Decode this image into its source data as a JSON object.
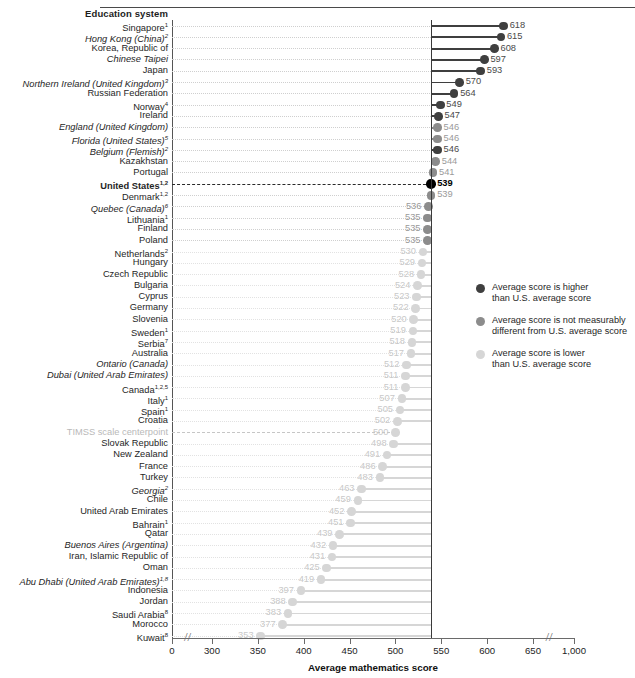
{
  "header": {
    "column_title": "Education system"
  },
  "axis": {
    "title": "Average mathematics score",
    "ticks": [
      "0",
      "300",
      "350",
      "400",
      "450",
      "500",
      "550",
      "600",
      "650",
      "1,000"
    ],
    "tick_values": [
      0,
      300,
      350,
      400,
      450,
      500,
      550,
      600,
      650,
      1000
    ]
  },
  "legend": {
    "position": "right-middle",
    "items": [
      {
        "color": "#3f3f3f",
        "line1": "Average score is higher",
        "line2": "than U.S. average score"
      },
      {
        "color": "#8c8c8c",
        "line1": "Average score is not measurably",
        "line2": "different from U.S. average score"
      },
      {
        "color": "#d6d6d6",
        "line1": "Average score is lower",
        "line2": "than U.S. average score"
      }
    ]
  },
  "colors": {
    "higher": "#3f3f3f",
    "same": "#8c8c8c",
    "lower": "#d6d6d6",
    "us": "#000000",
    "value_higher": "#4a4a4a",
    "value_same": "#9a9a9a",
    "value_lower": "#c9c9c9"
  },
  "chart_data": {
    "type": "bar",
    "xlabel": "Average mathematics score",
    "ylabel": "Education system",
    "xlim": [
      0,
      1000
    ],
    "axis_break": true,
    "reference_line_value": 539,
    "reference_line_label": "United States",
    "centerpoint_value": 500,
    "centerpoint_label": "TIMSS scale centerpoint",
    "grid": "dotted-horizontal",
    "legend_categories": [
      "higher",
      "same",
      "lower"
    ],
    "categories": [
      "Singapore",
      "Hong Kong (China)",
      "Korea, Republic of",
      "Chinese Taipei",
      "Japan",
      "Northern Ireland (United Kingdom)",
      "Russian Federation",
      "Norway",
      "Ireland",
      "England (United Kingdom)",
      "Florida (United States)",
      "Belgium (Flemish)",
      "Kazakhstan",
      "Portugal",
      "United States",
      "Denmark",
      "Quebec (Canada)",
      "Lithuania",
      "Finland",
      "Poland",
      "Netherlands",
      "Hungary",
      "Czech Republic",
      "Bulgaria",
      "Cyprus",
      "Germany",
      "Slovenia",
      "Sweden",
      "Serbia",
      "Australia",
      "Ontario (Canada)",
      "Dubai (United Arab Emirates)",
      "Canada",
      "Italy",
      "Spain",
      "Croatia",
      "TIMSS scale centerpoint",
      "Slovak Republic",
      "New Zealand",
      "France",
      "Turkey",
      "Georgia",
      "Chile",
      "United Arab Emirates",
      "Bahrain",
      "Qatar",
      "Buenos Aires (Argentina)",
      "Iran, Islamic Republic of",
      "Oman",
      "Abu Dhabi (United Arab Emirates)",
      "Indonesia",
      "Jordan",
      "Saudi Arabia",
      "Morocco",
      "Kuwait"
    ],
    "values": [
      618,
      615,
      608,
      597,
      593,
      570,
      564,
      549,
      547,
      546,
      546,
      546,
      544,
      541,
      539,
      539,
      536,
      535,
      535,
      535,
      530,
      529,
      528,
      524,
      523,
      522,
      520,
      519,
      518,
      517,
      512,
      511,
      511,
      507,
      505,
      502,
      500,
      498,
      491,
      486,
      483,
      463,
      459,
      452,
      451,
      439,
      432,
      431,
      425,
      419,
      397,
      388,
      383,
      377,
      353
    ]
  },
  "rows": [
    {
      "label": "Singapore",
      "sup": "1",
      "italic": false,
      "bold": false,
      "value": 618,
      "status": "higher"
    },
    {
      "label": "Hong Kong (China)",
      "sup": "2",
      "italic": true,
      "bold": false,
      "value": 615,
      "status": "higher"
    },
    {
      "label": "Korea, Republic of",
      "sup": "",
      "italic": false,
      "bold": false,
      "value": 608,
      "status": "higher"
    },
    {
      "label": "Chinese Taipei",
      "sup": "",
      "italic": true,
      "bold": false,
      "value": 597,
      "status": "higher"
    },
    {
      "label": "Japan",
      "sup": "",
      "italic": false,
      "bold": false,
      "value": 593,
      "status": "higher"
    },
    {
      "label": "Northern Ireland (United Kingdom)",
      "sup": "3",
      "italic": true,
      "bold": false,
      "value": 570,
      "status": "higher"
    },
    {
      "label": "Russian Federation",
      "sup": "",
      "italic": false,
      "bold": false,
      "value": 564,
      "status": "higher"
    },
    {
      "label": "Norway",
      "sup": "4",
      "italic": false,
      "bold": false,
      "value": 549,
      "status": "higher"
    },
    {
      "label": "Ireland",
      "sup": "",
      "italic": false,
      "bold": false,
      "value": 547,
      "status": "higher"
    },
    {
      "label": "England (United Kingdom)",
      "sup": "",
      "italic": true,
      "bold": false,
      "value": 546,
      "status": "same"
    },
    {
      "label": "Florida (United States)",
      "sup": "5",
      "italic": true,
      "bold": false,
      "value": 546,
      "status": "same"
    },
    {
      "label": "Belgium (Flemish)",
      "sup": "2",
      "italic": true,
      "bold": false,
      "value": 546,
      "status": "higher"
    },
    {
      "label": "Kazakhstan",
      "sup": "",
      "italic": false,
      "bold": false,
      "value": 544,
      "status": "same"
    },
    {
      "label": "Portugal",
      "sup": "",
      "italic": false,
      "bold": false,
      "value": 541,
      "status": "same"
    },
    {
      "label": "United States",
      "sup": "1,2",
      "italic": false,
      "bold": true,
      "value": 539,
      "status": "us"
    },
    {
      "label": "Denmark",
      "sup": "1,2",
      "italic": false,
      "bold": false,
      "value": 539,
      "status": "same"
    },
    {
      "label": "Quebec (Canada)",
      "sup": "6",
      "italic": true,
      "bold": false,
      "value": 536,
      "status": "same"
    },
    {
      "label": "Lithuania",
      "sup": "1",
      "italic": false,
      "bold": false,
      "value": 535,
      "status": "same"
    },
    {
      "label": "Finland",
      "sup": "",
      "italic": false,
      "bold": false,
      "value": 535,
      "status": "same"
    },
    {
      "label": "Poland",
      "sup": "",
      "italic": false,
      "bold": false,
      "value": 535,
      "status": "same"
    },
    {
      "label": "Netherlands",
      "sup": "2",
      "italic": false,
      "bold": false,
      "value": 530,
      "status": "lower"
    },
    {
      "label": "Hungary",
      "sup": "",
      "italic": false,
      "bold": false,
      "value": 529,
      "status": "lower"
    },
    {
      "label": "Czech Republic",
      "sup": "",
      "italic": false,
      "bold": false,
      "value": 528,
      "status": "lower"
    },
    {
      "label": "Bulgaria",
      "sup": "",
      "italic": false,
      "bold": false,
      "value": 524,
      "status": "lower"
    },
    {
      "label": "Cyprus",
      "sup": "",
      "italic": false,
      "bold": false,
      "value": 523,
      "status": "lower"
    },
    {
      "label": "Germany",
      "sup": "",
      "italic": false,
      "bold": false,
      "value": 522,
      "status": "lower"
    },
    {
      "label": "Slovenia",
      "sup": "",
      "italic": false,
      "bold": false,
      "value": 520,
      "status": "lower"
    },
    {
      "label": "Sweden",
      "sup": "1",
      "italic": false,
      "bold": false,
      "value": 519,
      "status": "lower"
    },
    {
      "label": "Serbia",
      "sup": "7",
      "italic": false,
      "bold": false,
      "value": 518,
      "status": "lower"
    },
    {
      "label": "Australia",
      "sup": "",
      "italic": false,
      "bold": false,
      "value": 517,
      "status": "lower"
    },
    {
      "label": "Ontario (Canada)",
      "sup": "",
      "italic": true,
      "bold": false,
      "value": 512,
      "status": "lower"
    },
    {
      "label": "Dubai (United Arab Emirates)",
      "sup": "",
      "italic": true,
      "bold": false,
      "value": 511,
      "status": "lower"
    },
    {
      "label": "Canada",
      "sup": "1,2,5",
      "italic": false,
      "bold": false,
      "value": 511,
      "status": "lower"
    },
    {
      "label": "Italy",
      "sup": "1",
      "italic": false,
      "bold": false,
      "value": 507,
      "status": "lower"
    },
    {
      "label": "Spain",
      "sup": "1",
      "italic": false,
      "bold": false,
      "value": 505,
      "status": "lower"
    },
    {
      "label": "Croatia",
      "sup": "",
      "italic": false,
      "bold": false,
      "value": 502,
      "status": "lower"
    },
    {
      "label": "TIMSS scale centerpoint",
      "sup": "",
      "italic": false,
      "bold": false,
      "value": 500,
      "status": "centerpoint"
    },
    {
      "label": "Slovak Republic",
      "sup": "",
      "italic": false,
      "bold": false,
      "value": 498,
      "status": "lower"
    },
    {
      "label": "New Zealand",
      "sup": "",
      "italic": false,
      "bold": false,
      "value": 491,
      "status": "lower"
    },
    {
      "label": "France",
      "sup": "",
      "italic": false,
      "bold": false,
      "value": 486,
      "status": "lower"
    },
    {
      "label": "Turkey",
      "sup": "",
      "italic": false,
      "bold": false,
      "value": 483,
      "status": "lower"
    },
    {
      "label": "Georgia",
      "sup": "2",
      "italic": true,
      "bold": false,
      "value": 463,
      "status": "lower"
    },
    {
      "label": "Chile",
      "sup": "",
      "italic": false,
      "bold": false,
      "value": 459,
      "status": "lower"
    },
    {
      "label": "United Arab Emirates",
      "sup": "",
      "italic": false,
      "bold": false,
      "value": 452,
      "status": "lower"
    },
    {
      "label": "Bahrain",
      "sup": "1",
      "italic": false,
      "bold": false,
      "value": 451,
      "status": "lower"
    },
    {
      "label": "Qatar",
      "sup": "",
      "italic": false,
      "bold": false,
      "value": 439,
      "status": "lower"
    },
    {
      "label": "Buenos Aires (Argentina)",
      "sup": "",
      "italic": true,
      "bold": false,
      "value": 432,
      "status": "lower"
    },
    {
      "label": "Iran, Islamic Republic of",
      "sup": "",
      "italic": false,
      "bold": false,
      "value": 431,
      "status": "lower"
    },
    {
      "label": "Oman",
      "sup": "",
      "italic": false,
      "bold": false,
      "value": 425,
      "status": "lower"
    },
    {
      "label": "Abu Dhabi (United Arab Emirates)",
      "sup": "1,8",
      "italic": true,
      "bold": false,
      "value": 419,
      "status": "lower"
    },
    {
      "label": "Indonesia",
      "sup": "",
      "italic": false,
      "bold": false,
      "value": 397,
      "status": "lower"
    },
    {
      "label": "Jordan",
      "sup": "",
      "italic": false,
      "bold": false,
      "value": 388,
      "status": "lower"
    },
    {
      "label": "Saudi Arabia",
      "sup": "8",
      "italic": false,
      "bold": false,
      "value": 383,
      "status": "lower"
    },
    {
      "label": "Morocco",
      "sup": "",
      "italic": false,
      "bold": false,
      "value": 377,
      "status": "lower"
    },
    {
      "label": "Kuwait",
      "sup": "8",
      "italic": false,
      "bold": false,
      "value": 353,
      "status": "lower"
    }
  ]
}
